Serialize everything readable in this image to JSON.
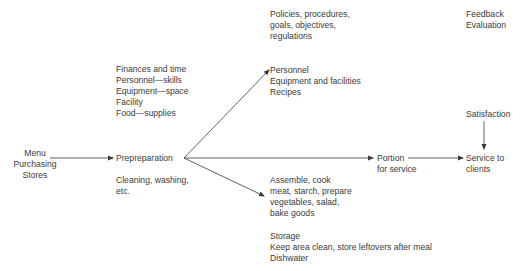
{
  "diagram": {
    "colors": {
      "text": "#3a3a3a",
      "line": "#3a3a3a",
      "background": "#ffffff"
    },
    "nodes": {
      "inputs": {
        "lines": [
          "Menu",
          "Purchasing",
          "Stores"
        ]
      },
      "resources": {
        "lines": [
          "Finances and time",
          "Personnel—skills",
          "Equipment—space",
          "Facility",
          "Food—supplies"
        ]
      },
      "prepreparation": {
        "label": "Prepreparation"
      },
      "prepreparation_note": {
        "lines": [
          "Cleaning, washing,",
          "etc."
        ]
      },
      "policies": {
        "lines": [
          "Policies, procedures,",
          "goals, objectives,",
          "regulations"
        ]
      },
      "personnel_block": {
        "lines": [
          "Personnel",
          "Equipment and facilities",
          "Recipes"
        ]
      },
      "assemble": {
        "lines": [
          "Assemble, cook",
          "meat, starch, prepare",
          "vegetables, salad,",
          "bake goods"
        ]
      },
      "storage": {
        "lines": [
          "Storage",
          "Keep area clean, store leftovers after meal",
          "Dishwater"
        ]
      },
      "portion": {
        "lines": [
          "Portion",
          "for service"
        ]
      },
      "feedback": {
        "lines": [
          "Feedback",
          "Evaluation"
        ]
      },
      "satisfaction": {
        "label": "Satisfaction"
      },
      "service": {
        "lines": [
          "Service to",
          "clients"
        ]
      }
    },
    "edges": [
      {
        "from": "Menu",
        "to": "Prepreparation"
      },
      {
        "from": "Prepreparation",
        "to": "Personnel"
      },
      {
        "from": "Prepreparation",
        "to": "Portion"
      },
      {
        "from": "Prepreparation",
        "to": "Assemble, cook"
      },
      {
        "from": "Portion",
        "to": "Service to clients"
      },
      {
        "from": "Satisfaction",
        "to": "Service to clients"
      }
    ]
  }
}
